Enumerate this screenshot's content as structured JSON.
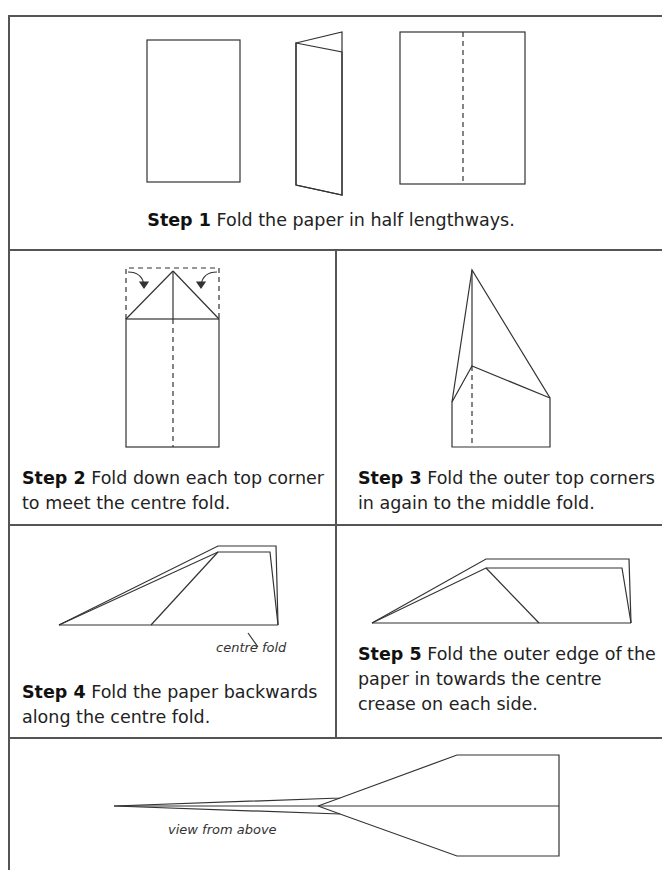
{
  "steps": [
    {
      "number": "Step 1",
      "text": "Fold the paper in half lengthways."
    },
    {
      "number": "Step 2",
      "text_line1": "Fold down each top corner",
      "text_line2": "to meet the centre fold."
    },
    {
      "number": "Step 3",
      "text_line1": "Fold the outer top corners",
      "text_line2": "in again to the middle fold."
    },
    {
      "number": "Step 4",
      "text_line1": "Fold the paper backwards",
      "text_line2": "along the centre fold."
    },
    {
      "number": "Step 5",
      "text_line1": "Fold the outer edge of the",
      "text_line2": "paper in towards the centre",
      "text_line3": "crease on each side."
    }
  ],
  "labels": {
    "centre_fold": "centre fold",
    "view_from_above": "view from above"
  }
}
